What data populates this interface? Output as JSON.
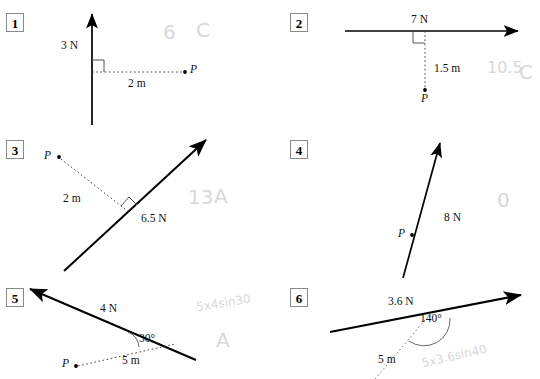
{
  "worksheet": {
    "title": "Moments of forces about point P",
    "panels": [
      {
        "number": "1",
        "force_label": "3 N",
        "distance_label": "2 m",
        "point_label": "P",
        "right_angle": true,
        "angle_label": "",
        "answer_value": "6",
        "answer_letter": "C",
        "working": ""
      },
      {
        "number": "2",
        "force_label": "7 N",
        "distance_label": "1.5 m",
        "point_label": "P",
        "right_angle": true,
        "angle_label": "",
        "answer_value": "10.5",
        "answer_letter": "C",
        "working": ""
      },
      {
        "number": "3",
        "force_label": "6.5 N",
        "distance_label": "2 m",
        "point_label": "P",
        "right_angle": true,
        "angle_label": "",
        "answer_value": "13",
        "answer_letter": "A",
        "working": ""
      },
      {
        "number": "4",
        "force_label": "8 N",
        "distance_label": "",
        "point_label": "P",
        "right_angle": false,
        "angle_label": "",
        "answer_value": "0",
        "answer_letter": "",
        "working": ""
      },
      {
        "number": "5",
        "force_label": "4 N",
        "distance_label": "5 m",
        "point_label": "P",
        "right_angle": false,
        "angle_label": "30°",
        "answer_value": "",
        "answer_letter": "A",
        "working": "5x4sin30"
      },
      {
        "number": "6",
        "force_label": "3.6 N",
        "distance_label": "5 m",
        "point_label": "",
        "right_angle": false,
        "angle_label": "140°",
        "answer_value": "",
        "answer_letter": "",
        "working": "5x3.6sin40"
      }
    ]
  },
  "colors": {
    "ink": "#000000",
    "pencil": "#d8d8d8",
    "box_border": "#8a8a8a",
    "dash": "#555555"
  }
}
